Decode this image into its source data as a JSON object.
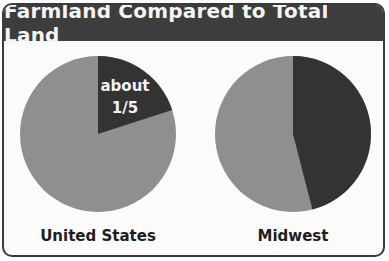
{
  "header": {
    "title": "Farmland Compared to Total Land"
  },
  "colors": {
    "farmland": "#333333",
    "other_land": "#8f8f8f",
    "header_bg": "#3d3d3d",
    "frame": "#3a3a3a"
  },
  "pies": [
    {
      "label": "United States",
      "farmland_label_line1": "about",
      "farmland_label_line2": "1/5",
      "farmland_fraction": 0.2
    },
    {
      "label": "Midwest",
      "farmland_fraction": 0.46
    }
  ],
  "chart_data": [
    {
      "type": "pie",
      "title": "Farmland Compared to Total Land",
      "subtitle": "United States",
      "categories": [
        "Farmland",
        "Other land"
      ],
      "values": [
        20,
        80
      ],
      "annotations": [
        "about 1/5"
      ]
    },
    {
      "type": "pie",
      "title": "Farmland Compared to Total Land",
      "subtitle": "Midwest",
      "categories": [
        "Farmland",
        "Other land"
      ],
      "values": [
        46,
        54
      ],
      "annotations": []
    }
  ]
}
